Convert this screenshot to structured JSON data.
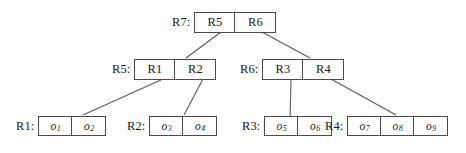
{
  "diagram": {
    "type": "tree",
    "background_color": "#ffffff",
    "line_color": "#4a4a4a",
    "text_color": "#1a1a1a",
    "nodes": [
      {
        "id": "R7",
        "level": "root",
        "label": "R7:",
        "entries": [
          "R5",
          "R6"
        ]
      },
      {
        "id": "R5",
        "level": "internal",
        "label": "R5:",
        "entries": [
          "R1",
          "R2"
        ]
      },
      {
        "id": "R6",
        "level": "internal",
        "label": "R6:",
        "entries": [
          "R3",
          "R4"
        ]
      },
      {
        "id": "R1",
        "level": "leaf",
        "label": "R1:",
        "entries": [
          "o1",
          "o2"
        ]
      },
      {
        "id": "R2",
        "level": "leaf",
        "label": "R2:",
        "entries": [
          "o3",
          "o4"
        ]
      },
      {
        "id": "R3",
        "level": "leaf",
        "label": "R3:",
        "entries": [
          "o5",
          "o6"
        ]
      },
      {
        "id": "R4",
        "level": "leaf",
        "label": "R4:",
        "entries": [
          "o7",
          "o8",
          "o9"
        ]
      }
    ],
    "edges": [
      {
        "from": "R7.R5",
        "to": "R5"
      },
      {
        "from": "R7.R6",
        "to": "R6"
      },
      {
        "from": "R5.R1",
        "to": "R1"
      },
      {
        "from": "R5.R2",
        "to": "R2"
      },
      {
        "from": "R6.R3",
        "to": "R3"
      },
      {
        "from": "R6.R4",
        "to": "R4"
      }
    ]
  },
  "labels": {
    "r7": "R7:",
    "r5": "R5:",
    "r6": "R6:",
    "leaf_r1": "R1:",
    "leaf_r2": "R2:",
    "leaf_r3": "R3:",
    "leaf_r4": "R4:"
  },
  "cells": {
    "r7": [
      "R5",
      "R6"
    ],
    "r5": [
      "R1",
      "R2"
    ],
    "r6": [
      "R3",
      "R4"
    ],
    "leaf_r1": [
      "o1",
      "o2"
    ],
    "leaf_r2": [
      "o3",
      "o4"
    ],
    "leaf_r3": [
      "o5",
      "o6"
    ],
    "leaf_r4": [
      "o7",
      "o8",
      "o9"
    ]
  },
  "object_glyphs": {
    "base": "o",
    "subscripts": [
      "1",
      "2",
      "3",
      "4",
      "5",
      "6",
      "7",
      "8",
      "9"
    ]
  }
}
